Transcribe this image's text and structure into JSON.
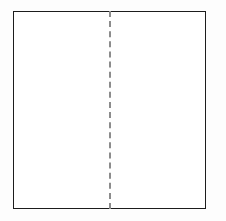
{
  "figure": {
    "title": "",
    "caption": "",
    "background_color": "#fdfdfd",
    "canvas": {
      "width": 226,
      "height": 221
    }
  },
  "shape": {
    "name": "rectangle",
    "label": "",
    "stroke_color": "#1c1c1c",
    "fill_color": "#ffffff",
    "stroke_width": 1.5,
    "x": 13,
    "y": 11,
    "width": 193,
    "height": 198
  },
  "fold_line": {
    "name": "vertical-dashed-line",
    "label": "",
    "orientation": "vertical",
    "style": "dashed",
    "stroke_color": "#8c8c8c",
    "stroke_width": 2,
    "x": 109,
    "y_start": 11,
    "y_end": 209,
    "dash_length": 8,
    "gap_length": 4
  },
  "annotations": {
    "labels": []
  }
}
